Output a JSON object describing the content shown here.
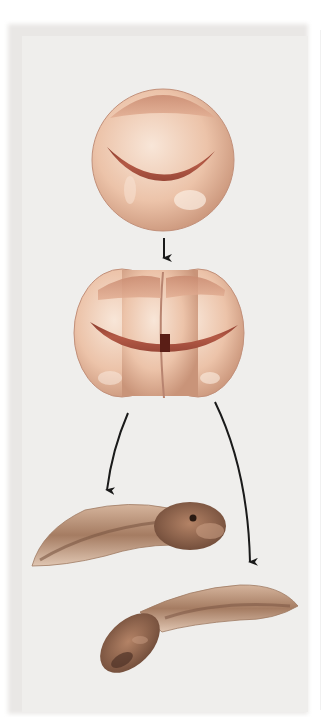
{
  "figure": {
    "stages": [
      {
        "id": "zygote",
        "label": "single-cell egg"
      },
      {
        "id": "two-cell",
        "label": "two-cell stage"
      },
      {
        "id": "tadpole-left",
        "label": "tadpole"
      },
      {
        "id": "tadpole-right",
        "label": "tadpole"
      }
    ],
    "arrows": [
      {
        "from": "zygote",
        "to": "two-cell"
      },
      {
        "from": "two-cell",
        "to": "tadpole-left"
      },
      {
        "from": "two-cell",
        "to": "tadpole-right"
      }
    ]
  },
  "colors": {
    "panel": "#efeeec",
    "egg_light": "#f4d9c6",
    "egg_mid": "#e6b79c",
    "egg_cap": "#d9a188",
    "band": "#a8503e",
    "band_dark": "#7a2e22",
    "tadpole_body": "#b58a6a",
    "tadpole_dark": "#6b4a38",
    "arrow": "#1a1a1a"
  }
}
